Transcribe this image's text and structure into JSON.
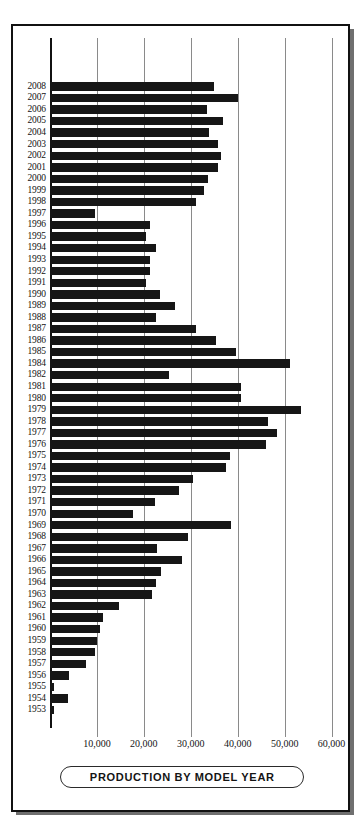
{
  "chart_data": {
    "type": "bar",
    "orientation": "horizontal",
    "title": "PRODUCTION BY MODEL YEAR",
    "xlabel": "",
    "ylabel": "",
    "xlim": [
      0,
      62000
    ],
    "grid": true,
    "gridline_axis": "x",
    "legend": null,
    "xticks": [
      10000,
      20000,
      30000,
      40000,
      50000,
      60000
    ],
    "xtick_labels": [
      "10,000",
      "20,000",
      "30,000",
      "40,000",
      "50,000",
      "60,000"
    ],
    "categories": [
      "2008",
      "2007",
      "2006",
      "2005",
      "2004",
      "2003",
      "2002",
      "2001",
      "2000",
      "1999",
      "1998",
      "1997",
      "1996",
      "1995",
      "1994",
      "1993",
      "1992",
      "1991",
      "1990",
      "1989",
      "1988",
      "1987",
      "1986",
      "1985",
      "1984",
      "1982",
      "1981",
      "1980",
      "1979",
      "1978",
      "1977",
      "1976",
      "1975",
      "1974",
      "1973",
      "1972",
      "1971",
      "1970",
      "1969",
      "1968",
      "1967",
      "1966",
      "1965",
      "1964",
      "1963",
      "1962",
      "1961",
      "1960",
      "1959",
      "1958",
      "1957",
      "1956",
      "1955",
      "1954",
      "1953"
    ],
    "values": [
      35000,
      40100,
      33500,
      36900,
      33900,
      35700,
      36400,
      35900,
      33700,
      32900,
      31000,
      9600,
      21200,
      20500,
      22600,
      21400,
      21200,
      20500,
      23500,
      26600,
      22600,
      31000,
      35400,
      39600,
      51200,
      25400,
      40600,
      40600,
      53400,
      46400,
      48400,
      46000,
      38400,
      37400,
      30500,
      27500,
      22300,
      17600,
      38600,
      29400,
      22900,
      28200,
      23700,
      22600,
      21800,
      14600,
      11200,
      10700,
      10100,
      9600,
      7600,
      4100,
      900,
      3900,
      900
    ],
    "bar_color": "#161616",
    "gridline_color": "#8a8a8a",
    "axis_color": "#111111"
  }
}
